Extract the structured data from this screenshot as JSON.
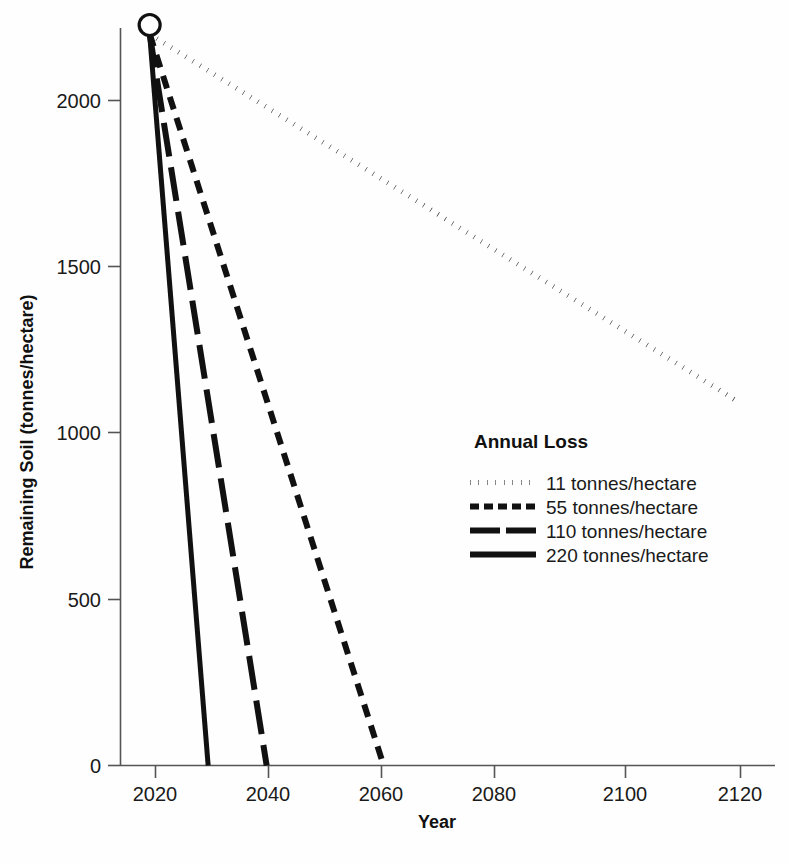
{
  "chart_data": {
    "type": "line",
    "title": "",
    "xlabel": "Year",
    "ylabel": "Remaining Soil (tonnes/hectare)",
    "xlim": [
      2014,
      2124
    ],
    "ylim": [
      0,
      2260
    ],
    "xticks": [
      "2020",
      "2040",
      "2060",
      "2080",
      "2100",
      "2120"
    ],
    "xtick_values": [
      2020,
      2040,
      2060,
      2080,
      2100,
      2120
    ],
    "yticks": [
      "0",
      "500",
      "1000",
      "1500",
      "2000"
    ],
    "ytick_values": [
      0,
      500,
      1000,
      1500,
      2000
    ],
    "grid": false,
    "legend_position": "center-right",
    "legend_title": "Annual Loss",
    "start_point": {
      "x": 2019,
      "y": 2200,
      "marker": "open-circle"
    },
    "series": [
      {
        "name": "11 tonnes/hectare",
        "annual_loss": 11,
        "style": "dotted",
        "x": [
          2019,
          2119
        ],
        "values": [
          2200,
          1100
        ],
        "endpoint_label": "2119"
      },
      {
        "name": "55 tonnes/hectare",
        "annual_loss": 55,
        "style": "dashed",
        "x": [
          2019,
          2059
        ],
        "values": [
          2200,
          0
        ],
        "endpoint_label": "2059"
      },
      {
        "name": "110 tonnes/hectare",
        "annual_loss": 110,
        "style": "long-dash",
        "x": [
          2019,
          2039
        ],
        "values": [
          2200,
          0
        ],
        "endpoint_label": "2039"
      },
      {
        "name": "220 tonnes/hectare",
        "annual_loss": 220,
        "style": "solid",
        "x": [
          2019,
          2029
        ],
        "values": [
          2200,
          0
        ],
        "endpoint_label": "2029"
      }
    ],
    "colors": {
      "line": "#111111",
      "axis": "#555555",
      "text": "#1a1a1a",
      "background": "#ffffff"
    }
  },
  "legend": {
    "title": "Annual Loss",
    "entries": [
      {
        "label": "11 tonnes/hectare",
        "style": "dotted"
      },
      {
        "label": "55 tonnes/hectare",
        "style": "dashed"
      },
      {
        "label": "110 tonnes/hectare",
        "style": "long-dash"
      },
      {
        "label": "220 tonnes/hectare",
        "style": "solid"
      }
    ]
  },
  "axes": {
    "x_title": "Year",
    "y_title": "Remaining Soil (tonnes/hectare)",
    "x_tick_labels": [
      "2020",
      "2040",
      "2060",
      "2080",
      "2100",
      "2120"
    ],
    "y_tick_labels": [
      "2000",
      "1500",
      "1000",
      "500",
      "0"
    ]
  }
}
